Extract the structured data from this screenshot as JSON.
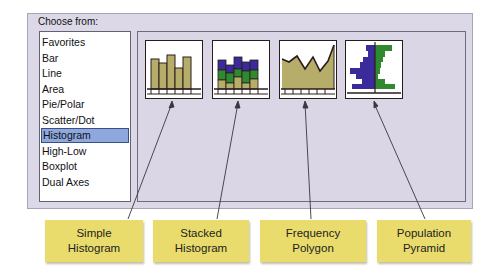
{
  "dialog": {
    "choose_label": "Choose from:",
    "list_items": [
      {
        "label": "Favorites"
      },
      {
        "label": "Bar"
      },
      {
        "label": "Line"
      },
      {
        "label": "Area"
      },
      {
        "label": "Pie/Polar"
      },
      {
        "label": "Scatter/Dot"
      },
      {
        "label": "Histogram",
        "selected": true
      },
      {
        "label": "High-Low"
      },
      {
        "label": "Boxplot"
      },
      {
        "label": "Dual Axes"
      }
    ],
    "selected_item": "Histogram"
  },
  "gallery": {
    "thumbnails": [
      {
        "icon": "simple-histogram-icon"
      },
      {
        "icon": "stacked-histogram-icon"
      },
      {
        "icon": "frequency-polygon-icon"
      },
      {
        "icon": "population-pyramid-icon"
      }
    ]
  },
  "callouts": [
    {
      "line1": "Simple",
      "line2": "Histogram"
    },
    {
      "line1": "Stacked",
      "line2": "Histogram"
    },
    {
      "line1": "Frequency",
      "line2": "Polygon"
    },
    {
      "line1": "Population",
      "line2": "Pyramid"
    }
  ],
  "colors": {
    "panel_bg": "#dcd8e8",
    "selection": "#8ea8de",
    "bar_tan": "#b6ad6a",
    "stack_blue": "#3a2a9a",
    "stack_green": "#2f8a2f",
    "callout_yellow": "#e9dc6c"
  }
}
